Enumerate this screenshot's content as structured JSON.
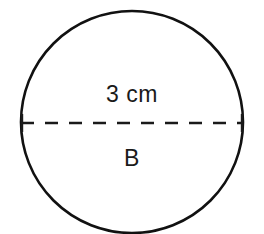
{
  "figure": {
    "kind": "circle-with-dashed-diameter",
    "diameter_label": "3 cm",
    "region_label": "B",
    "stroke_color": "#111111",
    "dash_color": "#1a1a1a",
    "fill_color": "#ffffff",
    "background_color": "#ffffff",
    "circle": {
      "center_x": 132,
      "center_y": 122,
      "radius": 111,
      "stroke_width": 2.6
    },
    "diameter_line": {
      "x1": 21,
      "y1": 123,
      "x2": 243,
      "y2": 123,
      "stroke_width": 2.4,
      "dash_pattern": "13 11"
    },
    "end_ticks": {
      "left_x": 22,
      "right_x": 242,
      "half_height": 9,
      "stroke_width": 2.4
    }
  },
  "chart_data": {
    "type": "diagram",
    "title": "",
    "shape": "circle",
    "annotations": [
      {
        "name": "diameter-measure",
        "text": "3 cm",
        "position": "above-diameter"
      },
      {
        "name": "region-name",
        "text": "B",
        "position": "below-diameter"
      }
    ],
    "measurements": [
      {
        "label": "diameter",
        "value": 3,
        "unit": "cm"
      }
    ]
  }
}
